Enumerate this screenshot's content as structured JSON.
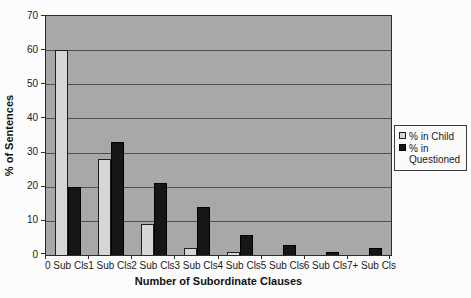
{
  "chart_data": {
    "type": "bar",
    "title": "",
    "xlabel": "Number of Subordinate Clauses",
    "ylabel": "% of Sentences",
    "categories": [
      "0 Sub Cls",
      "1 Sub Cls",
      "2 Sub Cls",
      "3 Sub Cls",
      "4 Sub Cls",
      "5 Sub Cls",
      "6 Sub Cls",
      "7+ Sub Cls"
    ],
    "series": [
      {
        "name": "% in Child",
        "color": "#d6d6d6",
        "border": "#1e1e1e",
        "values": [
          60,
          28,
          9,
          2,
          1,
          0,
          0,
          0
        ]
      },
      {
        "name": "% in Questioned",
        "color": "#161616",
        "border": "#000000",
        "values": [
          20,
          33,
          21,
          14,
          6,
          3,
          1,
          2
        ]
      }
    ],
    "ylim": [
      0,
      70
    ],
    "ytick_step": 10,
    "ytick_labels": [
      "0",
      "10",
      "20",
      "30",
      "40",
      "50",
      "60",
      "70"
    ],
    "grid": "horizontal",
    "legend_position": "right",
    "colors": {
      "page_bg": "#fcfcfc",
      "plot_bg": "#a8a8a8",
      "grid_line": "#4f4f4f",
      "axis": "#2b2b2b",
      "legend_bg": "#fafafa",
      "legend_border": "#3a3a3a",
      "text": "#1a1a1a"
    }
  }
}
